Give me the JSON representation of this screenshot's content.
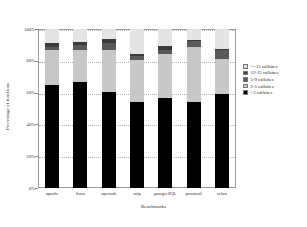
{
  "chart_data": {
    "type": "bar",
    "subtype": "stacked-bar-100-percent",
    "title": "",
    "xlabel": "Benchmarks",
    "ylabel": "Percentage of functions",
    "ylim": [
      0,
      100
    ],
    "yticks": [
      "0%",
      "20%",
      "40%",
      "60%",
      "80%",
      "100%"
    ],
    "ytick_values": [
      0,
      20,
      40,
      60,
      80,
      100
    ],
    "grid": true,
    "legend_position": "right",
    "categories": [
      "apache",
      "linux",
      "openssh",
      "snip",
      "postgreSQL",
      "procmail",
      "zebra"
    ],
    "series": [
      {
        "name": "<2 callsites",
        "color": "#000000",
        "values": [
          65,
          66.5,
          60.5,
          54,
          56.5,
          54,
          59
        ]
      },
      {
        "name": "2-5 callsites",
        "color": "#c8c8c8",
        "values": [
          21.5,
          20.5,
          26.5,
          26.5,
          27.5,
          35,
          22
        ]
      },
      {
        "name": "5-9 callsites",
        "color": "#5a5a5a",
        "values": [
          2.5,
          3,
          4,
          2.5,
          3,
          3.5,
          6
        ]
      },
      {
        "name": "12-15 callsites",
        "color": "#3c3c3c",
        "values": [
          2,
          2,
          2.5,
          1.5,
          2.5,
          0.5,
          0.5
        ]
      },
      {
        "name": ">=15 callsites",
        "color": "#e4e4e4",
        "values": [
          9,
          8,
          6.5,
          15.5,
          10.5,
          7,
          12.5
        ]
      }
    ]
  },
  "legend": {
    "items": [
      {
        "label": ">=15 callsites",
        "color": "#e4e4e4"
      },
      {
        "label": "12-15 callsites",
        "color": "#3c3c3c"
      },
      {
        "label": "5-9 callsites",
        "color": "#5a5a5a"
      },
      {
        "label": "2-5 callsites",
        "color": "#c8c8c8"
      },
      {
        "label": "<2 callsites",
        "color": "#000000"
      }
    ]
  },
  "axes": {
    "x_title": "Benchmarks",
    "y_title": "Percentage of functions"
  }
}
